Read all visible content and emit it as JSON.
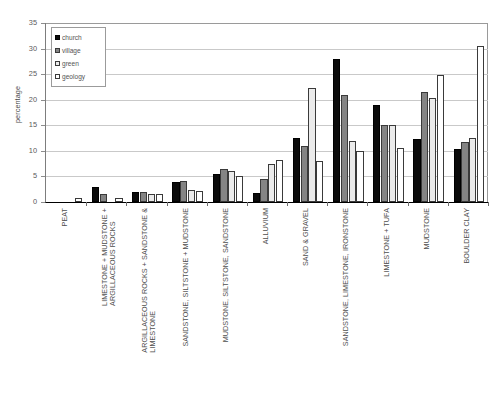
{
  "chart_data": {
    "type": "bar",
    "title": "",
    "xlabel": "",
    "ylabel": "percentage",
    "ylim": [
      0,
      35
    ],
    "ytick_step": 5,
    "yticks": [
      "0",
      "5",
      "10",
      "15",
      "20",
      "25",
      "30",
      "35"
    ],
    "grid": "horizontal",
    "legend_position": "top-left-inside",
    "categories": [
      "PEAT",
      "LIMESTONE + MUDSTONE + ARGILLACEOUS ROCKS",
      "ARGILLACEOUS ROCKS + SANDSTONE & LIMESTONE",
      "SANDSTONE, SILTSTONE + MUDSTONE",
      "MUDSTONE, SILTSTONE, SANDSTONE",
      "ALLUVIUM",
      "SAND & GRAVEL",
      "SANDSTONE, LIMESTONE, IRONSTONE",
      "LIMESTONE + TUFA",
      "MUDSTONE",
      "BOULDER CLAY"
    ],
    "category_lines": [
      [
        "PEAT",
        ""
      ],
      [
        "LIMESTONE + MUDSTONE +",
        "ARGILLACEOUS ROCKS"
      ],
      [
        "ARGILLACEOUS ROCKS + SANDSTONE &",
        "LIMESTONE"
      ],
      [
        "SANDSTONE, SILTSTONE + MUDSTONE",
        ""
      ],
      [
        "MUDSTONE, SILTSTONE, SANDSTONE",
        ""
      ],
      [
        "ALLUVIUM",
        ""
      ],
      [
        "SAND & GRAVEL",
        ""
      ],
      [
        "SANDSTONE, LIMESTONE, IRONSTONE",
        ""
      ],
      [
        "LIMESTONE + TUFA",
        ""
      ],
      [
        "MUDSTONE",
        ""
      ],
      [
        "BOULDER CLAY",
        ""
      ]
    ],
    "series": [
      {
        "name": "church",
        "color": "#0b0b0b",
        "values": [
          0,
          3.0,
          2.0,
          4.0,
          5.5,
          1.8,
          12.5,
          28.0,
          19.0,
          12.3,
          10.3
        ]
      },
      {
        "name": "village",
        "color": "#848484",
        "values": [
          0,
          1.5,
          2.0,
          4.2,
          6.5,
          4.5,
          11.0,
          21.0,
          15.0,
          21.5,
          11.8
        ]
      },
      {
        "name": "green",
        "color": "#ebebeb",
        "values": [
          0,
          0,
          1.6,
          2.3,
          6.0,
          7.5,
          22.2,
          12.0,
          15.0,
          20.3,
          12.5
        ]
      },
      {
        "name": "geology",
        "color": "#ffffff",
        "values": [
          0.8,
          0.8,
          1.6,
          2.2,
          5.0,
          8.3,
          8.0,
          10.0,
          10.5,
          24.8,
          30.5
        ]
      }
    ]
  },
  "legend": {
    "items": [
      {
        "label": "church"
      },
      {
        "label": "village"
      },
      {
        "label": "green"
      },
      {
        "label": "geology"
      }
    ]
  }
}
